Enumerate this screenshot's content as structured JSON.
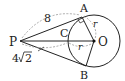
{
  "diagram": {
    "type": "geometry",
    "points": {
      "P": {
        "label": "P",
        "x": 20,
        "y": 41
      },
      "O": {
        "label": "O",
        "x": 94,
        "y": 41
      },
      "A": {
        "label": "A",
        "x": 82,
        "y": 18
      },
      "B": {
        "label": "B",
        "x": 86,
        "y": 65
      },
      "C": {
        "label": "C",
        "x": 68,
        "y": 41
      }
    },
    "circle": {
      "center": "O",
      "radius": 26
    },
    "segments": [
      {
        "from": "P",
        "to": "A",
        "style": "solid"
      },
      {
        "from": "P",
        "to": "B",
        "style": "solid"
      },
      {
        "from": "P",
        "to": "O",
        "style": "solid"
      },
      {
        "from": "A",
        "to": "O",
        "style": "solid"
      },
      {
        "from": "O",
        "to": "B",
        "style": "solid"
      }
    ],
    "annotations": {
      "PA_length": "8",
      "PC_length": "4√2",
      "radius_label_1": "r",
      "radius_label_2": "r"
    },
    "right_angle_at": "A"
  },
  "labels": {
    "P": "P",
    "O": "O",
    "A": "A",
    "B": "B",
    "C": "C",
    "len8": "8",
    "len4": "4",
    "sqrt2": "2",
    "r1": "r",
    "r2": "r"
  }
}
